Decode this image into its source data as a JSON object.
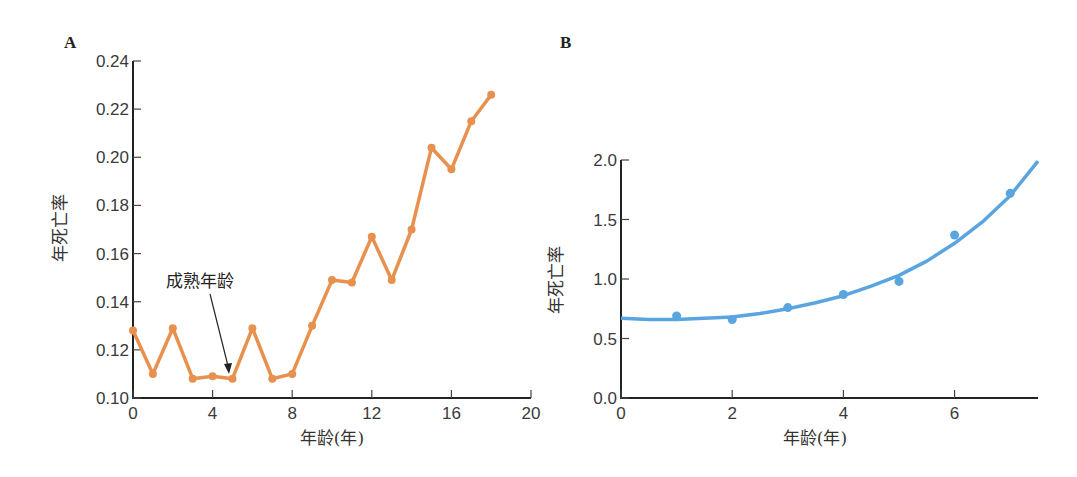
{
  "chart_data": [
    {
      "panel": "A",
      "type": "line",
      "title": "",
      "xlabel": "年龄(年)",
      "ylabel": "年死亡率",
      "xlim": [
        0,
        20
      ],
      "ylim": [
        0.1,
        0.24
      ],
      "xticks": [
        "0",
        "4",
        "8",
        "12",
        "16",
        "20"
      ],
      "yticks": [
        "0.10",
        "0.12",
        "0.14",
        "0.16",
        "0.18",
        "0.20",
        "0.22",
        "0.24"
      ],
      "grid": false,
      "color": "#E8904E",
      "x": [
        0,
        1,
        2,
        3,
        4,
        5,
        6,
        7,
        8,
        9,
        10,
        11,
        12,
        13,
        14,
        15,
        16,
        17,
        18
      ],
      "values": [
        0.128,
        0.11,
        0.129,
        0.108,
        0.109,
        0.108,
        0.129,
        0.108,
        0.11,
        0.13,
        0.149,
        0.148,
        0.167,
        0.149,
        0.17,
        0.204,
        0.195,
        0.215,
        0.226
      ],
      "annotations": [
        {
          "text": "成熟年龄",
          "points_to": {
            "x": 5,
            "y": 0.108
          }
        }
      ]
    },
    {
      "panel": "B",
      "type": "scatter",
      "title": "",
      "xlabel": "年龄(年)",
      "ylabel": "年死亡率",
      "xlim": [
        0,
        7.5
      ],
      "ylim": [
        0.0,
        2.0
      ],
      "xticks": [
        "0",
        "2",
        "4",
        "6"
      ],
      "yticks": [
        "0.0",
        "0.5",
        "1.0",
        "1.5",
        "2.0"
      ],
      "grid": false,
      "color": "#5AA5E0",
      "x": [
        1,
        2,
        3,
        4,
        5,
        6,
        7
      ],
      "values": [
        0.69,
        0.66,
        0.76,
        0.87,
        0.98,
        1.37,
        1.72
      ],
      "fit_curve": {
        "description": "smooth fitted exponential-like curve",
        "x": [
          0,
          0.5,
          1,
          1.5,
          2,
          2.5,
          3,
          3.5,
          4,
          4.5,
          5,
          5.5,
          6,
          6.5,
          7,
          7.5
        ],
        "y": [
          0.67,
          0.66,
          0.66,
          0.67,
          0.68,
          0.71,
          0.75,
          0.8,
          0.86,
          0.94,
          1.03,
          1.15,
          1.3,
          1.48,
          1.7,
          1.99
        ]
      }
    }
  ],
  "panels": {
    "a": {
      "label": "A",
      "annotation": "成熟年龄"
    },
    "b": {
      "label": "B"
    }
  }
}
